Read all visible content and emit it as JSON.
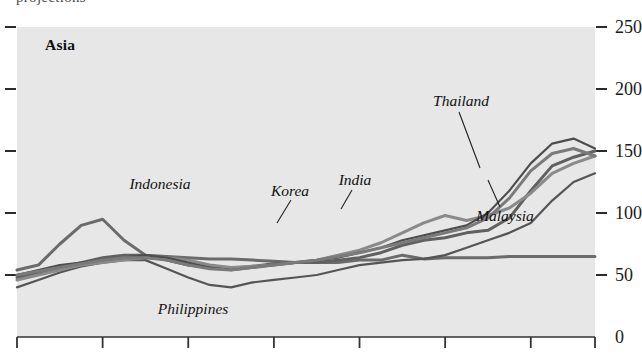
{
  "figure": {
    "clipped_title_above": "projections",
    "panel_label": "Asia",
    "background_color": "#e7e7e7",
    "line_colors": {
      "dark": "#1c1c1c",
      "mid": "#555555",
      "gray": "#777777",
      "light": "#8e8e8e"
    }
  },
  "chart_data": {
    "type": "line",
    "title": "Asia",
    "xlabel": "",
    "ylabel": "",
    "ylim": [
      0,
      250
    ],
    "yticks": [
      0,
      50,
      100,
      150,
      200,
      250
    ],
    "ytick_labels": [
      "0",
      "50",
      "100",
      "150",
      "200",
      "250"
    ],
    "xticks": [
      0,
      4,
      8,
      12,
      16,
      20,
      24,
      27
    ],
    "xtick_labels": [
      "",
      "",
      "",
      "",
      "",
      "",
      "",
      ""
    ],
    "grid": false,
    "legend": "inline-annotations",
    "x": [
      0,
      1,
      2,
      3,
      4,
      5,
      6,
      7,
      8,
      9,
      10,
      11,
      12,
      13,
      14,
      15,
      16,
      17,
      18,
      19,
      20,
      21,
      22,
      23,
      24,
      25,
      26,
      27
    ],
    "series": [
      {
        "name": "Indonesia",
        "color": "#6b6b6b",
        "label_x": 160,
        "label_y": 184,
        "leader": null,
        "values": [
          54,
          58,
          75,
          90,
          95,
          78,
          66,
          65,
          64,
          63,
          63,
          62,
          61,
          60,
          60,
          60,
          62,
          62,
          66,
          63,
          64,
          64,
          64,
          65,
          65,
          65,
          65,
          65
        ]
      },
      {
        "name": "Philippines",
        "color": "#555555",
        "label_x": 193,
        "label_y": 309,
        "leader": null,
        "values": [
          40,
          46,
          52,
          57,
          60,
          62,
          62,
          55,
          48,
          42,
          40,
          44,
          46,
          48,
          50,
          54,
          58,
          60,
          62,
          63,
          66,
          72,
          78,
          84,
          92,
          110,
          125,
          132
        ]
      },
      {
        "name": "Korea",
        "color": "#606060",
        "label_x": 290,
        "label_y": 191,
        "leader": {
          "x1": 291,
          "y1": 200,
          "x2": 277,
          "y2": 223
        },
        "values": [
          48,
          52,
          56,
          60,
          64,
          66,
          66,
          62,
          58,
          56,
          55,
          57,
          59,
          60,
          60,
          62,
          64,
          68,
          74,
          78,
          80,
          84,
          86,
          96,
          118,
          138,
          145,
          150
        ]
      },
      {
        "name": "India",
        "color": "#8a8a8a",
        "label_x": 355,
        "label_y": 180,
        "leader": {
          "x1": 352,
          "y1": 190,
          "x2": 341,
          "y2": 209
        },
        "values": [
          46,
          50,
          54,
          58,
          60,
          62,
          64,
          64,
          62,
          58,
          56,
          57,
          58,
          60,
          62,
          66,
          70,
          76,
          84,
          92,
          98,
          94,
          98,
          104,
          116,
          132,
          140,
          146
        ]
      },
      {
        "name": "Thailand",
        "color": "#4d4d4d",
        "label_x": 461,
        "label_y": 101,
        "leader": {
          "x1": 459,
          "y1": 112,
          "x2": 480,
          "y2": 168
        },
        "values": [
          50,
          54,
          58,
          60,
          62,
          64,
          66,
          64,
          60,
          56,
          54,
          56,
          58,
          60,
          62,
          64,
          68,
          72,
          78,
          82,
          86,
          90,
          100,
          118,
          140,
          156,
          160,
          152
        ]
      },
      {
        "name": "Malaysia",
        "color": "#7a7a7a",
        "label_x": 505,
        "label_y": 216,
        "leader": {
          "x1": 500,
          "y1": 207,
          "x2": 488,
          "y2": 180
        },
        "values": [
          50,
          53,
          56,
          59,
          62,
          64,
          64,
          62,
          58,
          55,
          54,
          56,
          58,
          60,
          62,
          65,
          68,
          72,
          76,
          80,
          84,
          88,
          96,
          112,
          134,
          148,
          152,
          146
        ]
      }
    ],
    "annotations": [
      {
        "text": "Asia",
        "style": "bold"
      },
      {
        "text": "Indonesia",
        "style": "italic"
      },
      {
        "text": "Philippines",
        "style": "italic"
      },
      {
        "text": "Korea",
        "style": "italic"
      },
      {
        "text": "India",
        "style": "italic"
      },
      {
        "text": "Thailand",
        "style": "italic"
      },
      {
        "text": "Malaysia",
        "style": "italic"
      }
    ]
  }
}
